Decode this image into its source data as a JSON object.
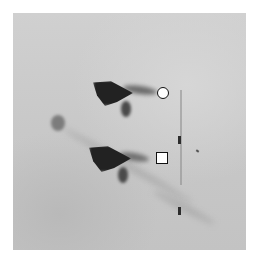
{
  "figure": {
    "type": "autoradiograph",
    "background_color": "#c9c9c9",
    "spot_color": "#222222",
    "markers": [
      {
        "shape": "circle",
        "fill": "#ffffff",
        "stroke": "#111111"
      },
      {
        "shape": "square",
        "fill": "#ffffff",
        "stroke": "#111111"
      }
    ],
    "spots": [
      {
        "name": "upper-major-spot",
        "intensity": "strong"
      },
      {
        "name": "lower-major-spot",
        "intensity": "strong"
      },
      {
        "name": "left-minor-spot",
        "intensity": "weak"
      }
    ],
    "reference_marks": 2
  }
}
